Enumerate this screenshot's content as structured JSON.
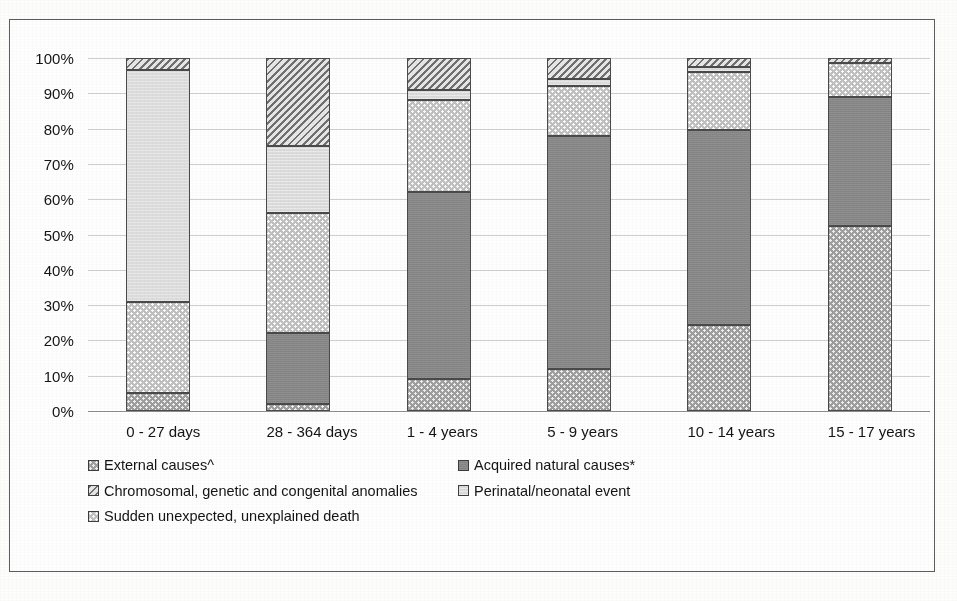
{
  "chart_data": {
    "type": "bar",
    "subtype": "stacked-percentage",
    "title": "",
    "xlabel": "",
    "ylabel": "",
    "ylim": [
      0,
      100
    ],
    "grid": true,
    "legend_position": "bottom",
    "categories": [
      "0 - 27 days",
      "28 - 364 days",
      "1 - 4 years",
      "5 - 9 years",
      "10 - 14 years",
      "15 - 17 years"
    ],
    "y_ticks": [
      "0%",
      "10%",
      "20%",
      "30%",
      "40%",
      "50%",
      "60%",
      "70%",
      "80%",
      "90%",
      "100%"
    ],
    "y_tick_values": [
      0,
      10,
      20,
      30,
      40,
      50,
      60,
      70,
      80,
      90,
      100
    ],
    "series": [
      {
        "name": "External causes^",
        "key": "external",
        "fill": "dotted-medium-gray",
        "color": "#9e9e9e",
        "values": [
          5,
          2,
          9,
          12,
          24.5,
          52.5
        ]
      },
      {
        "name": "Acquired natural causes*",
        "key": "acquired",
        "fill": "solid-dark-gray",
        "color": "#898989",
        "values": [
          0,
          20,
          53,
          66,
          55,
          36.5
        ]
      },
      {
        "name": "Sudden unexpected, unexplained death",
        "key": "sudden",
        "fill": "dotted-light-gray",
        "color": "#c0c0c0",
        "values": [
          26,
          34,
          26,
          14,
          16.5,
          9.5
        ]
      },
      {
        "name": "Perinatal/neonatal event",
        "key": "perinatal",
        "fill": "very-light-gray",
        "color": "#dedede",
        "values": [
          65.5,
          19,
          3,
          2,
          1.5,
          0
        ]
      },
      {
        "name": "Chromosomal, genetic and congenital anomalies",
        "key": "chromosomal",
        "fill": "diagonal-hatch",
        "color": "#e6e6e6",
        "values": [
          3.5,
          25,
          9,
          6,
          2.5,
          1.5
        ]
      }
    ],
    "stack_boundaries": [
      [
        5,
        5,
        31,
        96.5,
        100
      ],
      [
        2,
        22,
        56,
        75,
        100
      ],
      [
        9,
        62,
        88,
        91,
        100
      ],
      [
        12,
        78,
        92,
        94,
        100
      ],
      [
        24.5,
        79.5,
        96,
        97.5,
        100
      ],
      [
        52.5,
        89,
        98.5,
        98.5,
        100
      ]
    ]
  },
  "legend": {
    "rows": [
      {
        "left": {
          "label": "External causes^",
          "swatch": "external"
        },
        "right": {
          "label": "Acquired natural causes*",
          "swatch": "acquired"
        }
      },
      {
        "left": {
          "label": "Chromosomal, genetic and congenital anomalies",
          "swatch": "chromosomal"
        },
        "right": {
          "label": "Perinatal/neonatal event",
          "swatch": "perinatal"
        }
      },
      {
        "left": {
          "label": "Sudden unexpected, unexplained death",
          "swatch": "sudden"
        },
        "right": null
      }
    ]
  }
}
